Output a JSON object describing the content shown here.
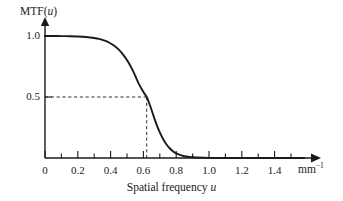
{
  "figure": {
    "background_color": "#ffffff",
    "ink_color": "#1a1a1a",
    "y_axis_title_main": "MTF(",
    "y_axis_title_var": "u",
    "y_axis_title_close": ")",
    "x_axis_title_main": "Spatial frequency ",
    "x_axis_title_var": "u",
    "x_unit_base": "mm",
    "x_unit_exponent": "−1"
  },
  "chart_data": {
    "type": "line",
    "title": "",
    "xlabel": "Spatial frequency u",
    "ylabel": "MTF(u)",
    "xlim": [
      0,
      1.6
    ],
    "ylim": [
      0,
      1.08
    ],
    "grid": false,
    "legend": null,
    "x_tick_labels": [
      "0",
      "0.2",
      "0.4",
      "0.6",
      "0.8",
      "1.0",
      "1.2",
      "1.4"
    ],
    "x_tick_values": [
      0,
      0.2,
      0.4,
      0.6,
      0.8,
      1.0,
      1.2,
      1.4
    ],
    "x_minor_tick_values": [
      0.1,
      0.3,
      0.5,
      0.7,
      0.9,
      1.1,
      1.3,
      1.5
    ],
    "y_tick_labels": [
      "1.0",
      "0.5"
    ],
    "y_tick_values": [
      1.0,
      0.5
    ],
    "x_unit": "mm−1",
    "annotations": [
      {
        "name": "half-amplitude-guide",
        "style": "dashed",
        "y_value": 0.5,
        "x_value": 0.62
      }
    ],
    "series": [
      {
        "name": "MTF(u)",
        "style": "solid",
        "x": [
          0.0,
          0.05,
          0.1,
          0.15,
          0.2,
          0.25,
          0.3,
          0.33,
          0.36,
          0.39,
          0.42,
          0.45,
          0.48,
          0.51,
          0.54,
          0.57,
          0.6,
          0.62,
          0.64,
          0.66,
          0.68,
          0.7,
          0.72,
          0.74,
          0.76,
          0.78,
          0.8,
          0.85,
          0.9,
          1.0,
          1.1,
          1.2,
          1.3,
          1.4,
          1.5,
          1.58
        ],
        "y": [
          1.0,
          1.0,
          0.999,
          0.998,
          0.996,
          0.992,
          0.984,
          0.976,
          0.964,
          0.947,
          0.922,
          0.888,
          0.841,
          0.78,
          0.704,
          0.614,
          0.541,
          0.5,
          0.432,
          0.352,
          0.276,
          0.21,
          0.156,
          0.113,
          0.08,
          0.056,
          0.038,
          0.014,
          0.006,
          0.001,
          0.0,
          0.0,
          0.0,
          0.0,
          0.0,
          0.0
        ]
      }
    ]
  },
  "axes_geometry": {
    "origin_x_px": 45,
    "origin_y_px": 158,
    "x_px_per_unit": 164,
    "y_px_per_unit": 122,
    "x_axis_end_px": 318,
    "y_axis_top_px": 19
  }
}
